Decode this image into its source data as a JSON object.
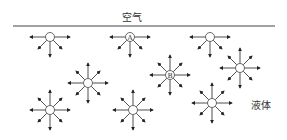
{
  "labels": {
    "air": "空气",
    "liquid": "液体"
  },
  "colors": {
    "line": "#444444",
    "arrow": "#222222"
  },
  "surface_line": {
    "x1": 13,
    "x2": 275,
    "y": 26
  },
  "molecules": [
    {
      "x": 50,
      "y": 37,
      "label": "",
      "surface": true
    },
    {
      "x": 130,
      "y": 37,
      "label": "A",
      "surface": true
    },
    {
      "x": 210,
      "y": 37,
      "label": "",
      "surface": true
    },
    {
      "x": 88,
      "y": 83,
      "label": "",
      "surface": false
    },
    {
      "x": 170,
      "y": 75,
      "label": "B",
      "surface": false
    },
    {
      "x": 240,
      "y": 68,
      "label": "",
      "surface": false
    },
    {
      "x": 50,
      "y": 110,
      "label": "",
      "surface": false
    },
    {
      "x": 133,
      "y": 110,
      "label": "",
      "surface": false
    },
    {
      "x": 212,
      "y": 103,
      "label": "",
      "surface": false
    }
  ]
}
